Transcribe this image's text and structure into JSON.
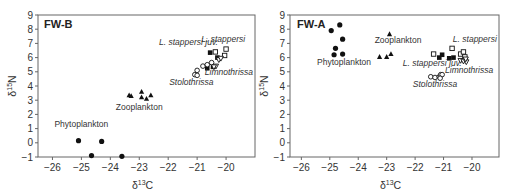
{
  "figure": {
    "panels": [
      {
        "id": "fw-b",
        "title": "FW-B"
      },
      {
        "id": "fw-a",
        "title": "FW-A"
      }
    ]
  },
  "chart_data": [
    {
      "type": "scatter",
      "title": "FW-B",
      "xlabel": "δ13C",
      "ylabel": "δ15N",
      "xlim": [
        -26.5,
        -19.0
      ],
      "ylim": [
        -1,
        9
      ],
      "xticks": [
        -26,
        -25,
        -24,
        -23,
        -22,
        -21,
        -20
      ],
      "yticks": [
        -1,
        0,
        1,
        2,
        3,
        4,
        5,
        6,
        7,
        8,
        9
      ],
      "grid": false,
      "legend": "none (inline group labels)",
      "series": [
        {
          "name": "Phytoplankton",
          "marker": "filled-circle",
          "label_pos": [
            -25.0,
            1.1
          ],
          "label_style": "normal",
          "points": [
            [
              -25.1,
              0.15
            ],
            [
              -24.3,
              0.1
            ],
            [
              -24.65,
              -0.9
            ],
            [
              -23.6,
              -0.95
            ]
          ]
        },
        {
          "name": "Zooplankton",
          "marker": "filled-triangle",
          "label_pos": [
            -23.0,
            2.3
          ],
          "label_style": "normal",
          "points": [
            [
              -23.35,
              3.35
            ],
            [
              -23.28,
              3.3
            ],
            [
              -22.92,
              3.6
            ],
            [
              -22.92,
              3.2
            ],
            [
              -22.75,
              3.1
            ],
            [
              -22.6,
              3.35
            ]
          ]
        },
        {
          "name": "L. stappersi juv.",
          "marker": "filled-square",
          "label_pos": [
            -21.3,
            6.9
          ],
          "label_style": "italic",
          "points": [
            [
              -20.55,
              6.35
            ],
            [
              -20.65,
              5.25
            ],
            [
              -20.45,
              5.35
            ],
            [
              -20.3,
              6.0
            ]
          ]
        },
        {
          "name": "L. stappersi",
          "marker": "open-square",
          "label_pos": [
            -20.1,
            7.1
          ],
          "label_style": "italic",
          "points": [
            [
              -20.37,
              6.4
            ],
            [
              -20.0,
              6.6
            ],
            [
              -20.05,
              6.15
            ]
          ]
        },
        {
          "name": "Limnothrissa",
          "marker": "open-triangle-down",
          "label_pos": [
            -19.9,
            4.8
          ],
          "label_style": "italic",
          "points": [
            [
              -20.25,
              5.85
            ],
            [
              -20.18,
              5.95
            ],
            [
              -20.35,
              5.4
            ],
            [
              -20.42,
              5.35
            ]
          ]
        },
        {
          "name": "Stolothrissa",
          "marker": "open-circle",
          "label_pos": [
            -21.2,
            4.1
          ],
          "label_style": "italic",
          "points": [
            [
              -20.8,
              5.4
            ],
            [
              -20.5,
              5.65
            ],
            [
              -21.0,
              5.1
            ],
            [
              -21.08,
              4.8
            ],
            [
              -21.0,
              4.75
            ],
            [
              -20.65,
              5.5
            ]
          ]
        }
      ]
    },
    {
      "type": "scatter",
      "title": "FW-A",
      "xlabel": "δ13C",
      "ylabel": "δ15N",
      "xlim": [
        -26.4,
        -19.05
      ],
      "ylim": [
        -1,
        9
      ],
      "xticks": [
        -26,
        -25,
        -24,
        -23,
        -22,
        -21,
        -20
      ],
      "yticks": [
        -1,
        0,
        1,
        2,
        3,
        4,
        5,
        6,
        7,
        8,
        9
      ],
      "grid": false,
      "legend": "none (inline group labels)",
      "series": [
        {
          "name": "Phytoplankton",
          "marker": "filled-circle",
          "label_pos": [
            -24.5,
            5.5
          ],
          "label_style": "normal",
          "points": [
            [
              -24.95,
              7.9
            ],
            [
              -24.65,
              8.3
            ],
            [
              -24.55,
              7.3
            ],
            [
              -24.8,
              6.65
            ],
            [
              -24.85,
              6.2
            ],
            [
              -24.55,
              6.25
            ]
          ]
        },
        {
          "name": "Zooplankton",
          "marker": "filled-triangle",
          "label_pos": [
            -22.6,
            7.0
          ],
          "label_style": "normal",
          "points": [
            [
              -22.9,
              7.65
            ],
            [
              -23.25,
              6.05
            ],
            [
              -23.0,
              6.05
            ],
            [
              -22.85,
              6.25
            ]
          ]
        },
        {
          "name": "L. stappersi",
          "marker": "open-square",
          "label_pos": [
            -19.9,
            7.1
          ],
          "label_style": "italic",
          "points": [
            [
              -21.35,
              6.25
            ],
            [
              -20.7,
              6.65
            ],
            [
              -20.4,
              6.25
            ],
            [
              -20.3,
              6.4
            ],
            [
              -20.25,
              6.05
            ]
          ]
        },
        {
          "name": "L. stappersi juv.",
          "marker": "filled-square",
          "label_pos": [
            -21.4,
            5.4
          ],
          "label_style": "italic",
          "points": [
            [
              -21.15,
              6.0
            ],
            [
              -21.05,
              6.2
            ],
            [
              -20.8,
              5.95
            ],
            [
              -20.65,
              6.0
            ]
          ]
        },
        {
          "name": "Limnothrissa",
          "marker": "open-triangle-down",
          "label_pos": [
            -20.1,
            4.9
          ],
          "label_style": "italic",
          "points": [
            [
              -20.4,
              5.8
            ],
            [
              -20.3,
              5.75
            ],
            [
              -20.2,
              5.7
            ],
            [
              -20.22,
              5.9
            ]
          ]
        },
        {
          "name": "Stolothrissa",
          "marker": "open-circle",
          "label_pos": [
            -21.3,
            3.9
          ],
          "label_style": "italic",
          "points": [
            [
              -21.45,
              4.65
            ],
            [
              -21.3,
              4.6
            ],
            [
              -21.15,
              4.65
            ],
            [
              -21.1,
              4.8
            ],
            [
              -21.05,
              4.8
            ],
            [
              -21.12,
              4.55
            ]
          ]
        }
      ]
    }
  ]
}
